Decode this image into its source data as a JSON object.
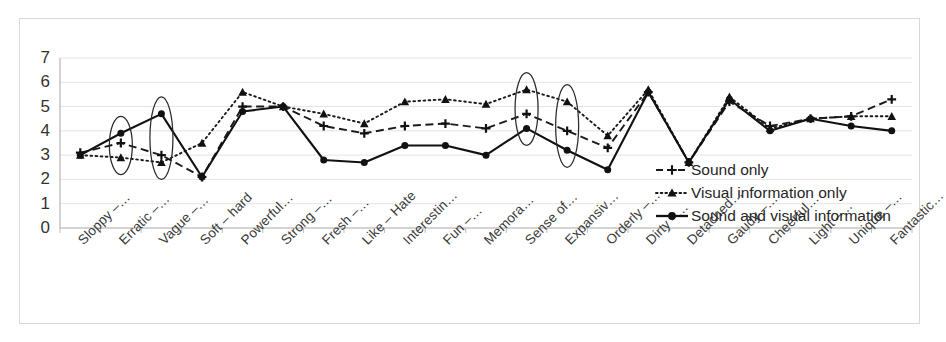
{
  "chart_data": {
    "type": "line",
    "title": "",
    "xlabel": "",
    "ylabel": "",
    "ylim": [
      0,
      7
    ],
    "yticks": [
      0,
      1,
      2,
      3,
      4,
      5,
      6,
      7
    ],
    "grid": true,
    "legend_position": "inside-right",
    "categories": [
      "Sloppy –…",
      "Erratic –…",
      "Vague –…",
      "Soft – hard",
      "Powerful…",
      "Strong –…",
      "Fresh –…",
      "Like – Hate",
      "Interestin…",
      "Fun –…",
      "Memora…",
      "Sense of…",
      "Expansiv…",
      "Orderly –…",
      "Dirty –…",
      "Detached…",
      "Gaudy –…",
      "Cheerful…",
      "Light –…",
      "Unique –…",
      "Fantastic…"
    ],
    "series": [
      {
        "name": "Sound only",
        "line_style": "dashed",
        "marker": "cross",
        "color": "#1a1a1a",
        "values": [
          3.1,
          3.5,
          3.0,
          2.1,
          5.0,
          5.0,
          4.2,
          3.9,
          4.2,
          4.3,
          4.1,
          4.7,
          4.0,
          3.3,
          5.6,
          2.7,
          5.2,
          4.2,
          4.5,
          4.6,
          5.3
        ]
      },
      {
        "name": "Visual information only",
        "line_style": "dotted",
        "marker": "triangle",
        "color": "#1a1a1a",
        "values": [
          3.0,
          2.9,
          2.7,
          3.5,
          5.6,
          5.0,
          4.7,
          4.3,
          5.2,
          5.3,
          5.1,
          5.7,
          5.2,
          3.8,
          5.7,
          2.7,
          5.4,
          4.1,
          4.5,
          4.6,
          4.6
        ]
      },
      {
        "name": "Sound and visual information",
        "line_style": "solid",
        "marker": "circle",
        "color": "#111111",
        "values": [
          3.0,
          3.9,
          4.7,
          2.1,
          4.8,
          5.0,
          2.8,
          2.7,
          3.4,
          3.4,
          3.0,
          4.1,
          3.2,
          2.4,
          5.6,
          2.7,
          5.3,
          4.0,
          4.5,
          4.2,
          4.0
        ]
      }
    ],
    "annotations": [
      {
        "type": "ellipse",
        "category_index": 1,
        "label": "highlight-erratic"
      },
      {
        "type": "ellipse",
        "category_index": 2,
        "label": "highlight-vague"
      },
      {
        "type": "ellipse",
        "category_index": 11,
        "label": "highlight-sense-of"
      },
      {
        "type": "ellipse",
        "category_index": 12,
        "label": "highlight-expansive"
      }
    ]
  },
  "legend": {
    "items": [
      {
        "label": "Sound only"
      },
      {
        "label": "Visual information only"
      },
      {
        "label": "Sound and visual information"
      }
    ]
  }
}
